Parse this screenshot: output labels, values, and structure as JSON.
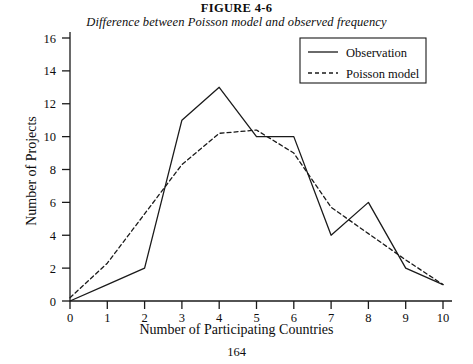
{
  "figure": {
    "caption": "FIGURE 4-6",
    "subtitle": "Difference between Poisson model and observed frequency",
    "page_number": "164"
  },
  "legend": {
    "position": "top-right",
    "entries": [
      {
        "label": "Observation",
        "style": "solid"
      },
      {
        "label": "Poisson model",
        "style": "dashed"
      }
    ]
  },
  "axes": {
    "x_title": "Number of Participating Countries",
    "y_title": "Number of Projects",
    "x_ticks": [
      "0",
      "1",
      "2",
      "3",
      "4",
      "5",
      "6",
      "7",
      "8",
      "9",
      "10"
    ],
    "y_ticks": [
      "0",
      "2",
      "4",
      "6",
      "8",
      "10",
      "12",
      "14",
      "16"
    ]
  },
  "colors": {
    "line": "#1a1a1a",
    "axis": "#1a1a1a",
    "background": "#ffffff"
  },
  "chart_data": {
    "type": "line",
    "title": "Difference between Poisson model and observed frequency",
    "xlabel": "Number of Participating Countries",
    "ylabel": "Number of Projects",
    "x": [
      0,
      1,
      2,
      3,
      4,
      5,
      6,
      7,
      8,
      9,
      10
    ],
    "xlim": [
      0,
      10
    ],
    "ylim": [
      0,
      16
    ],
    "ytick_step": 2,
    "grid": false,
    "legend_position": "top-right",
    "series": [
      {
        "name": "Observation",
        "style": "solid",
        "values": [
          0,
          1,
          2,
          11,
          13,
          10,
          10,
          4,
          6,
          2,
          1
        ]
      },
      {
        "name": "Poisson model",
        "style": "dashed",
        "values": [
          0.2,
          2.3,
          5.3,
          8.3,
          10.2,
          10.4,
          9.0,
          5.7,
          4.1,
          2.5,
          1.0
        ]
      }
    ]
  }
}
